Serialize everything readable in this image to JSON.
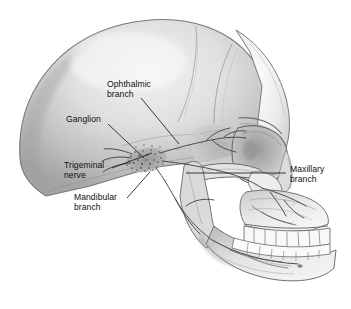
{
  "figure": {
    "background_color": "#ffffff",
    "width": 351,
    "height": 309
  },
  "palette": {
    "bone_light": "#f2f2f2",
    "bone_mid": "#d8d8d8",
    "bone_shadow": "#a9a9a9",
    "bone_deep_shadow": "#8d8d8d",
    "cranium_light": "#ededed",
    "cranium_mid": "#c6c6c6",
    "outline": "#6f6f6f",
    "outline_dark": "#4a4a4a",
    "nerve": "#5a5a5a",
    "nerve_dark": "#3c3c3c",
    "label_text": "#101010",
    "leader_line": "#1a1a1a"
  },
  "labels": [
    {
      "id": "ophthalmic",
      "name": "ophthalmic-branch-label",
      "lines": [
        "Ophthalmic",
        "branch"
      ],
      "text": "Ophthalmic branch",
      "x": 107,
      "y": 79,
      "leader": {
        "x1": 141,
        "y1": 98,
        "x2": 179,
        "y2": 144
      }
    },
    {
      "id": "ganglion",
      "name": "ganglion-label",
      "lines": [
        "Ganglion"
      ],
      "text": "Ganglion",
      "x": 66,
      "y": 114,
      "leader": {
        "x1": 108,
        "y1": 124,
        "x2": 144,
        "y2": 158
      }
    },
    {
      "id": "trigeminal",
      "name": "trigeminal-nerve-label",
      "lines": [
        "Trigeminal",
        "nerve"
      ],
      "text": "Trigeminal nerve",
      "x": 64,
      "y": 160,
      "leader": {
        "x1": 112,
        "y1": 168,
        "x2": 152,
        "y2": 153
      }
    },
    {
      "id": "mandibular",
      "name": "mandibular-branch-label",
      "lines": [
        "Mandibular",
        "branch"
      ],
      "text": "Mandibular branch",
      "x": 74,
      "y": 192,
      "leader": {
        "x1": 127,
        "y1": 198,
        "x2": 150,
        "y2": 172
      }
    },
    {
      "id": "maxillary",
      "name": "maxillary-branch-label",
      "lines": [
        "Maxillary",
        "branch"
      ],
      "text": "Maxillary branch",
      "x": 290,
      "y": 164,
      "leader": {
        "x1": 286,
        "y1": 173,
        "x2": 186,
        "y2": 173
      }
    }
  ],
  "anatomy": {
    "structures": [
      "cranial vault",
      "frontal bone",
      "parietal bone",
      "temporal bone",
      "occipital bone",
      "orbit",
      "zygomatic arch",
      "nasal aperture",
      "maxilla",
      "mandible",
      "upper teeth row",
      "lower teeth row",
      "mental foramen",
      "coronoid process",
      "condylar process"
    ],
    "nerve": {
      "name": "trigeminal nerve",
      "ganglion": "trigeminal (Gasserian) ganglion",
      "branches": [
        "ophthalmic branch",
        "maxillary branch",
        "mandibular branch"
      ]
    },
    "view": "left lateral",
    "style": "pencil / stipple medical illustration, greyscale"
  }
}
